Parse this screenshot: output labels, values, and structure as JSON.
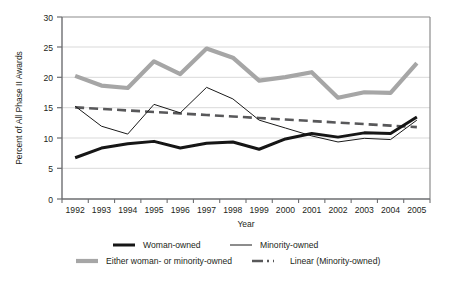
{
  "chart_data": {
    "type": "line",
    "title": "",
    "xlabel": "Year",
    "ylabel": "Percent of All Phase II Awards",
    "categories": [
      "1992",
      "1993",
      "1994",
      "1995",
      "1996",
      "1997",
      "1998",
      "1999",
      "2000",
      "2001",
      "2002",
      "2003",
      "2004",
      "2005"
    ],
    "x": [
      1992,
      1993,
      1994,
      1995,
      1996,
      1997,
      1998,
      1999,
      2000,
      2001,
      2002,
      2003,
      2004,
      2005
    ],
    "ylim": [
      0,
      30
    ],
    "yticks": [
      0,
      5,
      10,
      15,
      20,
      25,
      30
    ],
    "grid": true,
    "legend_position": "bottom",
    "series": [
      {
        "name": "Woman-owned",
        "style": "thick-black-solid",
        "color": "#161616",
        "values": [
          6.8,
          8.4,
          9.1,
          9.5,
          8.4,
          9.2,
          9.4,
          8.2,
          9.9,
          10.8,
          10.2,
          10.9,
          10.8,
          13.5
        ]
      },
      {
        "name": "Minority-owned",
        "style": "thin-black-solid",
        "color": "#1a1a1a",
        "values": [
          15.3,
          12.0,
          10.7,
          15.6,
          14.2,
          18.4,
          16.5,
          13.0,
          11.7,
          10.4,
          9.4,
          10.0,
          9.8,
          13.0
        ]
      },
      {
        "name": "Either woman- or minority-owned",
        "style": "thick-gray-solid",
        "color": "#a6a6a6",
        "values": [
          20.3,
          18.7,
          18.3,
          22.7,
          20.6,
          24.8,
          23.3,
          19.5,
          20.1,
          20.9,
          16.7,
          17.6,
          17.5,
          22.4
        ]
      },
      {
        "name": "Linear (Minority-owned)",
        "style": "thick-gray-dashed",
        "color": "#58585a",
        "values": [
          15.1,
          14.85,
          14.6,
          14.35,
          14.1,
          13.85,
          13.6,
          13.35,
          13.1,
          12.85,
          12.6,
          12.35,
          12.1,
          11.85
        ]
      }
    ]
  },
  "legend": {
    "items": [
      {
        "label": "Woman-owned",
        "swatch": "thick-black-solid"
      },
      {
        "label": "Minority-owned",
        "swatch": "thin-black-solid"
      },
      {
        "label": "Either woman- or minority-owned",
        "swatch": "thick-gray-solid"
      },
      {
        "label": "Linear (Minority-owned)",
        "swatch": "thick-gray-dashed"
      }
    ]
  },
  "colors": {
    "woman_owned": "#161616",
    "minority_owned": "#1a1a1a",
    "either": "#a6a6a6",
    "trend": "#58585a",
    "axis": "#6d6e71",
    "grid": "#d9d9d9",
    "text": "#231f20"
  }
}
